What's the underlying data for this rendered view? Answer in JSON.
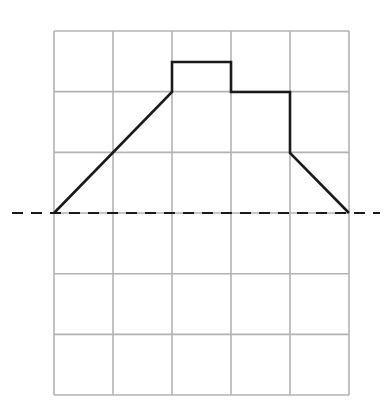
{
  "diagram": {
    "type": "grid-shape-with-reflection-line",
    "grid": {
      "columns": 5,
      "rows": 6,
      "origin_px": [
        54,
        31
      ],
      "cell_width_px": 59,
      "cell_height_px": 60.67,
      "line_color": "#b3b3b3"
    },
    "shape": {
      "description": "Closed outline above dashed line: slope up from left, raised block in middle column, step down, then slope down to right",
      "stroke_color": "#1a1a1a",
      "vertices_grid_units": [
        [
          0,
          3
        ],
        [
          2,
          1
        ],
        [
          2,
          0.5
        ],
        [
          3,
          0.5
        ],
        [
          3,
          1
        ],
        [
          4,
          1
        ],
        [
          4,
          2
        ],
        [
          5,
          3
        ]
      ],
      "vertices_px": [
        [
          54,
          213
        ],
        [
          172,
          92
        ],
        [
          172,
          62
        ],
        [
          231,
          62
        ],
        [
          231,
          92
        ],
        [
          290,
          92
        ],
        [
          290,
          153
        ],
        [
          349,
          213
        ]
      ]
    },
    "mirror_line": {
      "style": "dashed",
      "y_px": 213,
      "x_start_px": 12,
      "x_end_px": 380,
      "grid_row": 3,
      "color": "#1a1a1a"
    }
  }
}
